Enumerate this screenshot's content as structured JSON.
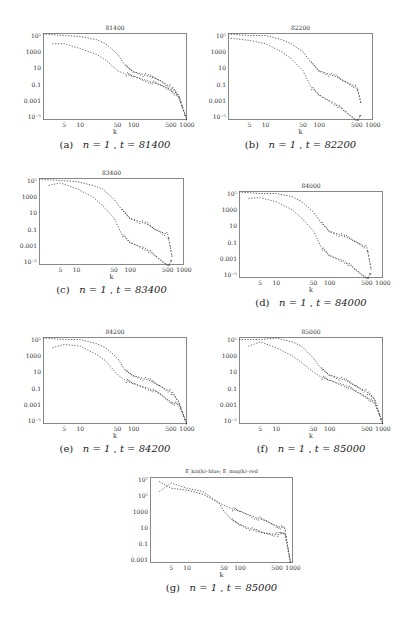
{
  "figure": {
    "panels": [
      {
        "id": "a",
        "title": "81400",
        "caption_label": "(a)",
        "caption_n": "n = 1",
        "caption_t": "t = 81400",
        "x": 43,
        "y": 33,
        "w": 144,
        "h": 87,
        "yticks": [
          "10⁵",
          "1000",
          "10",
          "0.1",
          "0.001",
          "10⁻⁵"
        ],
        "xticks": [
          "5",
          "10",
          "50",
          "100",
          "500",
          "1000"
        ],
        "xlabel": "k",
        "kmax": 1000,
        "yexp": [
          -5,
          5.6
        ]
      },
      {
        "id": "b",
        "title": "82200",
        "caption_label": "(b)",
        "caption_n": "n = 1",
        "caption_t": "t = 82200",
        "x": 228,
        "y": 33,
        "w": 145,
        "h": 87,
        "yticks": [
          "10⁵",
          "1000",
          "10",
          "0.1",
          "0.001",
          "10⁻⁵"
        ],
        "xticks": [
          "5",
          "10",
          "50",
          "100",
          "500",
          "1000"
        ],
        "xlabel": "k",
        "kmax": 600,
        "yexp": [
          -5,
          5.6
        ]
      },
      {
        "id": "c",
        "title": "83400",
        "caption_label": "(c)",
        "caption_n": "n = 1",
        "caption_t": "t = 83400",
        "x": 39,
        "y": 178,
        "w": 145,
        "h": 87,
        "yticks": [
          "10⁵",
          "1000",
          "10",
          "0.1",
          "0.001",
          "10⁻⁵"
        ],
        "xticks": [
          "5",
          "10",
          "50",
          "100",
          "500",
          "1000"
        ],
        "xlabel": "k",
        "kmax": 600,
        "yexp": [
          -5,
          5.6
        ]
      },
      {
        "id": "d",
        "title": "84000",
        "caption_label": "(d)",
        "caption_n": "n = 1",
        "caption_t": "t = 84000",
        "x": 239,
        "y": 191,
        "w": 144,
        "h": 87,
        "yticks": [
          "10⁵",
          "1000",
          "10",
          "0.1",
          "0.001",
          "10⁻⁵"
        ],
        "xticks": [
          "5",
          "10",
          "50",
          "100",
          "500",
          "1000"
        ],
        "xlabel": "k",
        "kmax": 600,
        "yexp": [
          -5,
          5.6
        ]
      },
      {
        "id": "e",
        "title": "84200",
        "caption_label": "(e)",
        "caption_n": "n = 1",
        "caption_t": "t = 84200",
        "x": 43,
        "y": 337,
        "w": 144,
        "h": 87,
        "yticks": [
          "10⁵",
          "1000",
          "10",
          "0.1",
          "0.001",
          "10⁻⁵"
        ],
        "xticks": [
          "5",
          "10",
          "50",
          "100",
          "500",
          "1000"
        ],
        "xlabel": "k",
        "kmax": 1000,
        "yexp": [
          -5,
          5.6
        ]
      },
      {
        "id": "f",
        "title": "85000",
        "caption_label": "(f)",
        "caption_n": "n = 1",
        "caption_t": "t = 85000",
        "x": 239,
        "y": 337,
        "w": 144,
        "h": 87,
        "yticks": [
          "10⁵",
          "1000",
          "10",
          "0.1",
          "0.001",
          "10⁻⁵"
        ],
        "xticks": [
          "5",
          "10",
          "50",
          "100",
          "500",
          "1000"
        ],
        "xlabel": "k",
        "kmax": 1000,
        "yexp": [
          -5,
          5.6
        ]
      },
      {
        "id": "g",
        "title": "E_kin(k)–blue; E_mag(k)–red",
        "caption_label": "(g)",
        "caption_n": "n = 1",
        "caption_t": "t = 85000",
        "x": 150,
        "y": 477,
        "w": 143,
        "h": 86,
        "yticks": [
          "10⁷",
          "10⁵",
          "1000",
          "10",
          "0.1",
          "0.001"
        ],
        "xticks": [
          "5",
          "10",
          "50",
          "100",
          "500",
          "1000"
        ],
        "xlabel": "k",
        "kmax": 1000,
        "yexp": [
          -3,
          7
        ]
      }
    ]
  },
  "chart_data": [
    {
      "type": "scatter",
      "title": "81400",
      "xlabel": "k",
      "ylabel": "",
      "xscale": "log",
      "yscale": "log",
      "xlim": [
        2,
        1000
      ],
      "ylim": [
        1e-05,
        400000.0
      ],
      "series": [
        {
          "name": "E_kin (upper)",
          "x": [
            2,
            5,
            10,
            20,
            30,
            50,
            70,
            100,
            200,
            300,
            500,
            700,
            1000
          ],
          "y": [
            300000.0,
            200000.0,
            150000.0,
            60000.0,
            20000.0,
            1000,
            40,
            8,
            2,
            0.8,
            0.1,
            0.01,
            1e-05
          ]
        },
        {
          "name": "E_mag (lower)",
          "x": [
            3,
            5,
            10,
            20,
            30,
            50,
            70,
            100,
            200,
            300,
            500,
            700,
            1000
          ],
          "y": [
            20000.0,
            20000.0,
            5000,
            1000,
            200,
            10,
            4,
            2,
            0.5,
            0.2,
            0.05,
            0.005,
            1e-05
          ]
        }
      ]
    },
    {
      "type": "scatter",
      "title": "82200",
      "xlabel": "k",
      "xscale": "log",
      "yscale": "log",
      "xlim": [
        2,
        1000
      ],
      "ylim": [
        1e-05,
        400000.0
      ],
      "series": [
        {
          "name": "E_kin (upper)",
          "x": [
            2,
            5,
            10,
            20,
            30,
            50,
            70,
            100,
            200,
            300,
            500,
            600
          ],
          "y": [
            300000.0,
            200000.0,
            200000.0,
            60000.0,
            20000.0,
            2000,
            100,
            10,
            2,
            0.5,
            0.1,
            0.001
          ]
        },
        {
          "name": "E_mag (lower)",
          "x": [
            2,
            5,
            10,
            20,
            30,
            50,
            70,
            100,
            200,
            300,
            500,
            600
          ],
          "y": [
            100000.0,
            50000.0,
            20000.0,
            2000,
            300,
            10,
            0.1,
            0.01,
            0.001,
            0.0001,
            1e-05,
            3e-05
          ]
        }
      ]
    },
    {
      "type": "scatter",
      "title": "83400",
      "xlabel": "k",
      "xscale": "log",
      "yscale": "log",
      "xlim": [
        2,
        1000
      ],
      "ylim": [
        1e-05,
        400000.0
      ],
      "series": [
        {
          "name": "E_kin (upper)",
          "x": [
            2,
            5,
            10,
            20,
            30,
            50,
            70,
            100,
            200,
            300,
            500,
            600
          ],
          "y": [
            300000.0,
            200000.0,
            150000.0,
            50000.0,
            20000.0,
            1000,
            50,
            5,
            1,
            0.2,
            0.05,
            0.0001
          ]
        },
        {
          "name": "E_mag (lower)",
          "x": [
            3,
            5,
            10,
            20,
            30,
            50,
            70,
            100,
            200,
            300,
            500,
            600
          ],
          "y": [
            50000.0,
            100000.0,
            20000.0,
            2000,
            200,
            5,
            0.05,
            0.005,
            0.001,
            0.0001,
            1e-05,
            3e-05
          ]
        }
      ]
    },
    {
      "type": "scatter",
      "title": "84000",
      "xlabel": "k",
      "xscale": "log",
      "yscale": "log",
      "xlim": [
        2,
        1000
      ],
      "ylim": [
        1e-05,
        400000.0
      ],
      "series": [
        {
          "name": "E_kin (upper)",
          "x": [
            2,
            5,
            10,
            20,
            30,
            50,
            70,
            100,
            200,
            300,
            500,
            600
          ],
          "y": [
            300000.0,
            200000.0,
            200000.0,
            80000.0,
            20000.0,
            1000,
            50,
            5,
            1,
            0.3,
            0.05,
            0.0001
          ]
        },
        {
          "name": "E_mag (lower)",
          "x": [
            3,
            5,
            10,
            20,
            30,
            50,
            70,
            100,
            200,
            300,
            500,
            600
          ],
          "y": [
            50000.0,
            60000.0,
            20000.0,
            2000,
            200,
            5,
            0.05,
            0.005,
            0.001,
            0.0001,
            1e-05,
            3e-05
          ]
        }
      ]
    },
    {
      "type": "scatter",
      "title": "84200",
      "xlabel": "k",
      "xscale": "log",
      "yscale": "log",
      "xlim": [
        2,
        1000
      ],
      "ylim": [
        1e-05,
        400000.0
      ],
      "series": [
        {
          "name": "E_kin (upper)",
          "x": [
            2,
            5,
            10,
            20,
            30,
            50,
            70,
            100,
            200,
            300,
            500,
            700,
            1000
          ],
          "y": [
            300000.0,
            200000.0,
            200000.0,
            60000.0,
            20000.0,
            1000,
            30,
            8,
            2,
            0.5,
            0.08,
            0.005,
            1e-05
          ]
        },
        {
          "name": "E_mag (lower)",
          "x": [
            3,
            5,
            10,
            20,
            30,
            50,
            70,
            100,
            200,
            300,
            500,
            700,
            1000
          ],
          "y": [
            20000.0,
            50000.0,
            30000.0,
            3000,
            500,
            10,
            2,
            0.8,
            0.2,
            0.05,
            0.005,
            0.002,
            1e-05
          ]
        }
      ]
    },
    {
      "type": "scatter",
      "title": "85000",
      "xlabel": "k",
      "xscale": "log",
      "yscale": "log",
      "xlim": [
        2,
        1000
      ],
      "ylim": [
        1e-05,
        400000.0
      ],
      "series": [
        {
          "name": "E_kin (upper)",
          "x": [
            2,
            5,
            10,
            20,
            30,
            50,
            70,
            100,
            200,
            300,
            500,
            700,
            1000
          ],
          "y": [
            200000.0,
            200000.0,
            300000.0,
            100000.0,
            30000.0,
            1000,
            50,
            10,
            2,
            0.5,
            0.08,
            0.01,
            1e-05
          ]
        },
        {
          "name": "E_mag (lower)",
          "x": [
            3,
            5,
            10,
            20,
            30,
            50,
            70,
            100,
            200,
            300,
            500,
            700,
            1000
          ],
          "y": [
            30000.0,
            100000.0,
            20000.0,
            2000,
            300,
            20,
            5,
            2,
            0.5,
            0.1,
            0.02,
            0.003,
            1e-05
          ]
        }
      ]
    },
    {
      "type": "scatter",
      "title": "E_kin(k)–blue; E_mag(k)–red",
      "xlabel": "k",
      "xscale": "log",
      "yscale": "log",
      "xlim": [
        2,
        1000
      ],
      "ylim": [
        0.001,
        10000000.0
      ],
      "series": [
        {
          "name": "E_kin(k) (blue)",
          "x": [
            3,
            5,
            10,
            20,
            40,
            50,
            70,
            100,
            200,
            300,
            500,
            700,
            900
          ],
          "y": [
            3000000.0,
            500000.0,
            300000.0,
            100000.0,
            10000.0,
            1000,
            100,
            30,
            5,
            3,
            2,
            3,
            0.001
          ]
        },
        {
          "name": "E_mag(k) (red)",
          "x": [
            3,
            5,
            10,
            20,
            40,
            50,
            70,
            100,
            200,
            300,
            500,
            700,
            900
          ],
          "y": [
            200000.0,
            2000000.0,
            500000.0,
            200000.0,
            10000.0,
            5000,
            2000,
            1000,
            200,
            80,
            20,
            10,
            0.001
          ]
        }
      ]
    }
  ]
}
